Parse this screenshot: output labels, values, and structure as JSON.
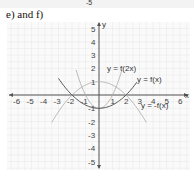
{
  "header": {
    "cut_label": "-5",
    "title": "e) and f)"
  },
  "axes": {
    "x_label": "x",
    "y_label": "y",
    "x_ticks": [
      "-6",
      "-5",
      "-4",
      "-3",
      "-2",
      "-1",
      "1",
      "2",
      "3",
      "4",
      "5",
      "6"
    ],
    "y_ticks": [
      "5",
      "4",
      "3",
      "2",
      "1",
      "-1",
      "-2",
      "-3",
      "-4",
      "-5"
    ]
  },
  "curve_labels": {
    "f2x": "y = f(2x)",
    "fx": "y = f(x)",
    "negfx": "y = -f(x)"
  },
  "colors": {
    "grid": "#e6e6e6",
    "axis": "#555555",
    "fx": "#555555",
    "f2x": "#aaaaaa",
    "negfx": "#aaaaaa"
  },
  "chart_data": {
    "type": "line",
    "title": "e) and f)",
    "xlabel": "x",
    "ylabel": "y",
    "xlim": [
      -6,
      6
    ],
    "ylim": [
      -5,
      5
    ],
    "grid": true,
    "series": [
      {
        "name": "y = f(x)",
        "x": [
          -3,
          -2,
          -1,
          0,
          1,
          2,
          2.8
        ],
        "y": [
          1.25,
          0,
          -0.75,
          -1,
          -0.75,
          0,
          0.96
        ]
      },
      {
        "name": "y = f(2x)",
        "x": [
          -1.7,
          -1,
          0,
          1,
          1.7
        ],
        "y": [
          1.9,
          0,
          -1,
          0,
          1.9
        ]
      },
      {
        "name": "y = -f(x)",
        "x": [
          -3.5,
          -2,
          -1,
          0,
          1,
          2,
          3.5
        ],
        "y": [
          -2.06,
          0,
          0.75,
          1,
          0.75,
          0,
          -2.06
        ]
      }
    ],
    "annotations": [
      "y = f(2x)",
      "y = f(x)",
      "y = -f(x)"
    ]
  }
}
